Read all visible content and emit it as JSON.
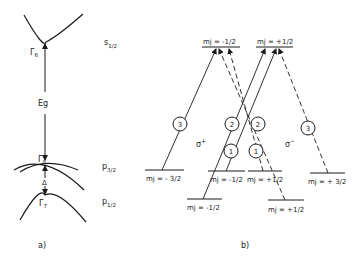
{
  "panel_a": {
    "caption": "a)",
    "labels": {
      "gamma6": "Γ6",
      "gamma8": "Γ8",
      "gamma7": "Γ7",
      "eg": "Eg",
      "delta": "Δ",
      "s12": "s1/2",
      "p32": "p3/2",
      "p12": "p1/2"
    }
  },
  "panel_b": {
    "caption": "b)",
    "sigma_plus": "σ+",
    "sigma_minus": "σ−",
    "levels": {
      "upper_left": "mj = -1/2",
      "upper_right": "mj = +1/2",
      "mid_m32": "mj = - 3/2",
      "mid_m12": "mj = -1/2",
      "mid_p12": "mj = +1/2",
      "mid_p32": "mj = + 3/2",
      "low_m12": "mj = -1/2",
      "low_p12": "mj = +1/2"
    },
    "transitions": [
      {
        "id": "3",
        "polarization": "σ+",
        "from": "mj=-3/2",
        "to": "mj=-1/2"
      },
      {
        "id": "2",
        "polarization": "σ+",
        "from": "mj=-1/2 (p1/2)",
        "to": "mj=+1/2"
      },
      {
        "id": "1",
        "polarization": "σ+",
        "from": "mj=-1/2 (p3/2)",
        "to": "mj=+1/2"
      },
      {
        "id": "2",
        "polarization": "σ−",
        "from": "mj=+1/2 (p1/2)",
        "to": "mj=-1/2"
      },
      {
        "id": "1",
        "polarization": "σ−",
        "from": "mj=+1/2 (p3/2)",
        "to": "mj=-1/2"
      },
      {
        "id": "3",
        "polarization": "σ−",
        "from": "mj=+3/2",
        "to": "mj=+1/2"
      }
    ],
    "circle_labels": [
      "3",
      "2",
      "1",
      "2",
      "1",
      "3"
    ]
  }
}
